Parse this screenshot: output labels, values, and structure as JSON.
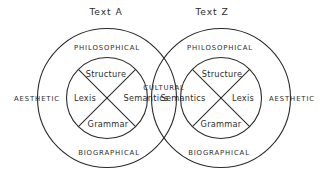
{
  "diagram": {
    "type": "venn",
    "titles": [
      {
        "text": "Text A",
        "x": 106,
        "y": 15
      },
      {
        "text": "Text Z",
        "x": 212,
        "y": 15
      }
    ],
    "circles": {
      "left": {
        "cx": 107,
        "cy": 98,
        "outer_r": 69.5,
        "inner_r": 40.5
      },
      "right": {
        "cx": 221,
        "cy": 98,
        "outer_r": 69.5,
        "inner_r": 40.5
      }
    },
    "left_set": {
      "name": "Text A",
      "ring_labels": {
        "top": "PHILOSOPHICAL",
        "left": "AESTHETIC",
        "bottom": "BIOGRAPHICAL"
      },
      "inner_sectors": {
        "top": "Structure",
        "left": "Lexis",
        "right": "Semantics",
        "bottom": "Grammar"
      }
    },
    "right_set": {
      "name": "Text Z",
      "ring_labels": {
        "top": "PHILOSOPHICAL",
        "right": "AESTHETIC",
        "bottom": "BIOGRAPHICAL"
      },
      "inner_sectors": {
        "top": "Structure",
        "left": "Semantics",
        "right": "Lexis",
        "bottom": "Grammar"
      }
    },
    "intersection": {
      "label": "CULTURAL",
      "x": 164,
      "y": 90
    },
    "colors": {
      "stroke": "#2b2b2b",
      "text": "#2e2e2e",
      "background": "#ffffff"
    }
  }
}
